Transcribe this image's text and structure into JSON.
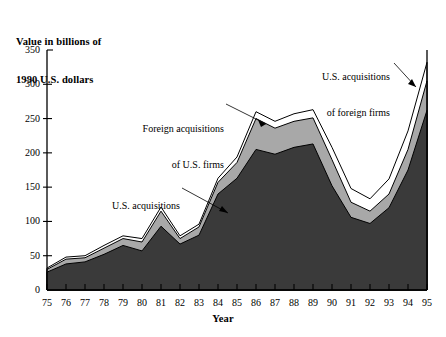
{
  "chart_data": {
    "type": "area",
    "title": "",
    "ylabel": "Value in billions of\n1990 U.S. dollars",
    "xlabel": "Year",
    "ylim": [
      0,
      350
    ],
    "yticks": [
      0,
      50,
      100,
      150,
      200,
      250,
      300,
      350
    ],
    "ytick_labels": [
      "0",
      "50",
      "100",
      "150",
      "200",
      "250",
      "300",
      "350"
    ],
    "grid": false,
    "legend_position": "annotations-on-plot",
    "stacked": true,
    "categories": [
      "75",
      "76",
      "77",
      "78",
      "79",
      "80",
      "81",
      "82",
      "83",
      "84",
      "85",
      "86",
      "87",
      "88",
      "89",
      "90",
      "91",
      "92",
      "93",
      "94",
      "95"
    ],
    "series": [
      {
        "name": "U.S. acquisitions of U.S. firms",
        "color": "#3a3a3a",
        "values": [
          26,
          38,
          41,
          52,
          65,
          57,
          93,
          67,
          80,
          140,
          163,
          205,
          198,
          208,
          213,
          152,
          106,
          97,
          120,
          175,
          262
        ]
      },
      {
        "name": "Foreign acquisitions of U.S. firms",
        "color": "#a8a8a8",
        "values": [
          4,
          7,
          6,
          9,
          10,
          13,
          22,
          8,
          12,
          17,
          23,
          45,
          38,
          38,
          38,
          38,
          22,
          18,
          20,
          30,
          43
        ]
      },
      {
        "name": "U.S. acquisitions of foreign firms",
        "color": "#ffffff",
        "values": [
          2,
          3,
          3,
          4,
          4,
          5,
          6,
          4,
          4,
          6,
          8,
          10,
          10,
          11,
          12,
          18,
          20,
          18,
          22,
          27,
          27
        ]
      }
    ],
    "totals": [
      32,
      48,
      50,
      65,
      79,
      75,
      121,
      79,
      96,
      163,
      194,
      260,
      246,
      257,
      263,
      208,
      148,
      133,
      162,
      232,
      332
    ],
    "annotations": [
      {
        "name": "us-acquisitions-of-foreign-firms",
        "text": "U.S. acquisitions\nof foreign firms"
      },
      {
        "name": "foreign-acquisitions-of-us-firms",
        "text": "Foreign acquisitions\nof U.S. firms"
      },
      {
        "name": "us-acquisitions-of-us-firms",
        "text": "U.S. acquisitions\nof U.S. firms"
      }
    ]
  },
  "axes": {
    "y_title_line1": "Value in billions of",
    "y_title_line2": "1990 U.S. dollars",
    "x_title": "Year"
  },
  "colors": {
    "dark_series": "#3a3a3a",
    "mid_series": "#a8a8a8",
    "light_series": "#ffffff",
    "outline": "#000000",
    "background": "#ffffff"
  }
}
